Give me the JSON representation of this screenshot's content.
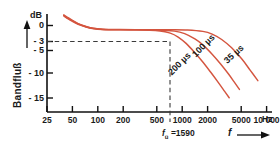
{
  "chart_data": {
    "type": "line",
    "title": "",
    "xlabel": "f",
    "xunit": "Hz",
    "ylabel": "Bandfluß",
    "yunit": "dB",
    "xscale": "log",
    "xlim": [
      25,
      14000
    ],
    "ylim": [
      -17,
      3
    ],
    "grid": false,
    "legend_position": "inline-along-curves",
    "xtick_labels": [
      "25",
      "50",
      "100",
      "200",
      "500",
      "1000",
      "2000",
      "5000",
      "10 000"
    ],
    "xtick_values": [
      25,
      50,
      100,
      200,
      500,
      1000,
      2000,
      5000,
      10000
    ],
    "ytick_labels": [
      "0",
      "- 3",
      "- 5",
      "- 10",
      "- 15"
    ],
    "ytick_values": [
      0,
      -3,
      -5,
      -10,
      -15
    ],
    "annotations": [
      {
        "name": "cutoff-frequency",
        "text_prefix": "f",
        "text_sub": "ü",
        "text_suffix": " =1590",
        "x_value": 1590,
        "y_value": -3
      },
      {
        "name": "minus-three-db-line",
        "text": "-3 dB reference",
        "y_value": -3
      }
    ],
    "series": [
      {
        "name": "35 µs",
        "label": "35 µs",
        "color": "#d4553f",
        "points": [
          [
            40,
            2.6
          ],
          [
            50,
            1.6
          ],
          [
            60,
            0.9
          ],
          [
            75,
            0.35
          ],
          [
            90,
            0.05
          ],
          [
            120,
            -0.15
          ],
          [
            200,
            -0.2
          ],
          [
            400,
            -0.2
          ],
          [
            800,
            -0.2
          ],
          [
            1300,
            -0.25
          ],
          [
            2000,
            -0.55
          ],
          [
            2600,
            -1.1
          ],
          [
            3400,
            -2.2
          ],
          [
            4500,
            -3.9
          ],
          [
            6000,
            -6.2
          ],
          [
            7600,
            -8.5
          ],
          [
            9400,
            -10.6
          ]
        ]
      },
      {
        "name": "100 µs",
        "label": "100 µs",
        "color": "#d4553f",
        "points": [
          [
            40,
            2.7
          ],
          [
            50,
            1.7
          ],
          [
            60,
            1.0
          ],
          [
            75,
            0.4
          ],
          [
            90,
            0.1
          ],
          [
            120,
            -0.15
          ],
          [
            250,
            -0.2
          ],
          [
            500,
            -0.25
          ],
          [
            900,
            -0.5
          ],
          [
            1200,
            -1.0
          ],
          [
            1600,
            -2.1
          ],
          [
            2000,
            -3.3
          ],
          [
            2600,
            -5.2
          ],
          [
            3300,
            -7.2
          ],
          [
            4100,
            -9.2
          ],
          [
            4900,
            -11.0
          ],
          [
            5600,
            -12.4
          ]
        ]
      },
      {
        "name": "200 µs",
        "label": "200 µs",
        "color": "#d4553f",
        "points": [
          [
            40,
            2.8
          ],
          [
            50,
            1.8
          ],
          [
            60,
            1.05
          ],
          [
            75,
            0.45
          ],
          [
            90,
            0.1
          ],
          [
            130,
            -0.15
          ],
          [
            300,
            -0.2
          ],
          [
            600,
            -0.45
          ],
          [
            800,
            -0.9
          ],
          [
            1000,
            -1.7
          ],
          [
            1250,
            -3.0
          ],
          [
            1600,
            -4.9
          ],
          [
            2000,
            -6.8
          ],
          [
            2500,
            -8.9
          ],
          [
            3100,
            -11.0
          ],
          [
            3700,
            -12.8
          ],
          [
            4200,
            -14.1
          ]
        ]
      }
    ]
  },
  "axes": {
    "y_title": "Bandfluß",
    "y_unit": "dB",
    "x_unit": "Hz",
    "x_symbol": "f"
  },
  "ticks": {
    "y": [
      {
        "label": "0",
        "value": 0
      },
      {
        "label": "- 3",
        "value": -3
      },
      {
        "label": "- 5",
        "value": -5
      },
      {
        "label": "- 10",
        "value": -10
      },
      {
        "label": "- 15",
        "value": -15
      }
    ],
    "x": [
      {
        "label": "25",
        "value": 25
      },
      {
        "label": "50",
        "value": 50
      },
      {
        "label": "100",
        "value": 100
      },
      {
        "label": "200",
        "value": 200
      },
      {
        "label": "500",
        "value": 500
      },
      {
        "label": "1000",
        "value": 1000
      },
      {
        "label": "2000",
        "value": 2000
      },
      {
        "label": "5000",
        "value": 5000
      },
      {
        "label": "10 000",
        "value": 10000
      }
    ]
  },
  "curve_labels": {
    "c35": "35 µs",
    "c100": "100 µs",
    "c200": "200 µs"
  },
  "cutoff": {
    "symbol": "f",
    "subscript": "ü",
    "equals_value": " =1590"
  },
  "colors": {
    "curve": "#d4553f",
    "axis": "#111111",
    "dashed": "#3a3a3a",
    "text": "#1a1a1a",
    "background": "#ffffff"
  }
}
